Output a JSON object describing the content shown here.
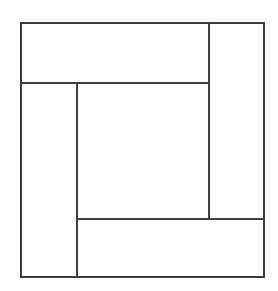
{
  "diagram": {
    "title": "Pinwheel Log Cabin Block",
    "description": "Square block subdivided into four perimeter strips arranged in a clockwise pinwheel around a central square",
    "type": "geometric-line-diagram",
    "background_color": "#fdfdfd",
    "line_color": "#3f4043",
    "line_width_px": 1.4,
    "canvas": {
      "width_px": 278,
      "height_px": 291
    },
    "outer_square": {
      "name": "outer-frame",
      "left_px": 21,
      "top_px": 23,
      "right_px": 264,
      "bottom_px": 277,
      "width_px": 243,
      "height_px": 254
    },
    "center_square": {
      "name": "center-square",
      "left_px": 77,
      "top_px": 83,
      "right_px": 209,
      "bottom_px": 219,
      "width_px": 132,
      "height_px": 136
    },
    "dividers": [
      {
        "name": "top-strip-bottom-edge",
        "orientation": "horizontal",
        "y_px": 83,
        "x_start_px": 21,
        "x_end_px": 209
      },
      {
        "name": "right-strip-left-edge",
        "orientation": "vertical",
        "x_px": 209,
        "y_start_px": 23,
        "y_end_px": 219
      },
      {
        "name": "bottom-strip-top-edge",
        "orientation": "horizontal",
        "y_px": 219,
        "x_start_px": 77,
        "x_end_px": 264
      },
      {
        "name": "left-strip-right-edge",
        "orientation": "vertical",
        "x_px": 77,
        "y_start_px": 83,
        "y_end_px": 277
      }
    ],
    "regions": [
      {
        "name": "top-strip",
        "label": "",
        "x_px": 21,
        "y_px": 23,
        "width_px": 188,
        "height_px": 60
      },
      {
        "name": "right-strip",
        "label": "",
        "x_px": 209,
        "y_px": 23,
        "width_px": 55,
        "height_px": 196
      },
      {
        "name": "bottom-strip",
        "label": "",
        "x_px": 77,
        "y_px": 219,
        "width_px": 187,
        "height_px": 58
      },
      {
        "name": "left-strip",
        "label": "",
        "x_px": 21,
        "y_px": 83,
        "width_px": 56,
        "height_px": 194
      },
      {
        "name": "center-square",
        "label": "",
        "x_px": 77,
        "y_px": 83,
        "width_px": 132,
        "height_px": 136
      }
    ]
  }
}
